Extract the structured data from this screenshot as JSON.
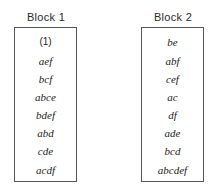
{
  "blocks": [
    {
      "title": "Block 1",
      "items": [
        "(1)",
        "aef",
        "bcf",
        "abce",
        "bdef",
        "abd",
        "cde",
        "acdf"
      ]
    },
    {
      "title": "Block 2",
      "items": [
        "be",
        "abf",
        "cef",
        "ac",
        "df",
        "ade",
        "bcd",
        "abcdef"
      ]
    }
  ]
}
